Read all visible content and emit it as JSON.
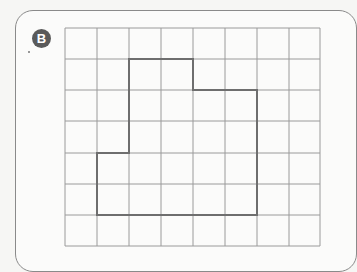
{
  "label": {
    "text": "B"
  },
  "grid": {
    "x_lines": [
      65,
      97,
      129,
      161,
      193,
      225,
      257,
      289,
      320
    ],
    "y_lines": [
      28,
      59,
      90,
      121,
      153,
      184,
      215,
      246
    ],
    "line_color": "#9a9a9a",
    "columns": 8,
    "rows": 7
  },
  "shape": {
    "description": "Rectilinear polygon outlined on grid",
    "vertices_grid": [
      [
        2,
        1
      ],
      [
        4,
        1
      ],
      [
        4,
        2
      ],
      [
        6,
        2
      ],
      [
        6,
        6
      ],
      [
        1,
        6
      ],
      [
        1,
        4
      ],
      [
        2,
        4
      ]
    ],
    "stroke_color": "#6e6e6e",
    "area_squares": 18
  },
  "colors": {
    "badge": "#5a5a5a",
    "border": "#8a8a8a",
    "background": "#f6f6f4"
  }
}
